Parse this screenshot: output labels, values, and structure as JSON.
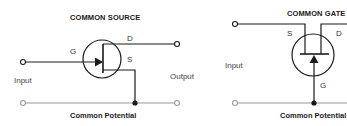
{
  "diagrams": [
    {
      "title": "COMMON SOURCE",
      "pins": {
        "gate": "G",
        "drain": "D",
        "source": "S"
      },
      "input_label": "Input",
      "output_label": "Output",
      "ground_label": "Common Potential"
    },
    {
      "title": "COMMON GATE",
      "pins": {
        "gate": "G",
        "drain": "D",
        "source": "S"
      },
      "input_label": "Input",
      "ground_label": "Common Potential"
    }
  ],
  "colors": {
    "wire": "#1a1a1a",
    "ground_wire": "#9a9a9a",
    "terminal_open": "#ffffff"
  }
}
